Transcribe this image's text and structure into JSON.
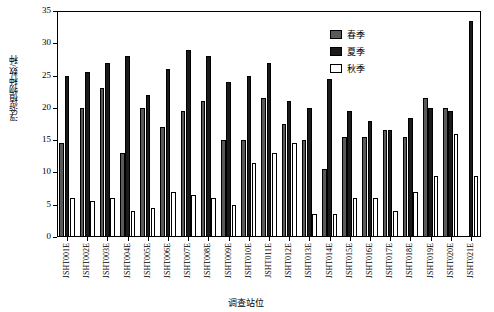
{
  "chart_data": {
    "type": "bar",
    "title": "",
    "xlabel": "调查站位",
    "ylabel": "浮游植物种数/种",
    "ylim": [
      0,
      35
    ],
    "yticks": [
      0,
      5,
      10,
      15,
      20,
      25,
      30,
      35
    ],
    "grid": false,
    "legend_position": "top-right",
    "categories": [
      "JSHT001E",
      "JSHT002E",
      "JSHT003E",
      "JSHT004E",
      "JSHT005E",
      "JSHT006E",
      "JSHT007E",
      "JSHT008E",
      "JSHT009E",
      "JSHT010E",
      "JSHT011E",
      "JSHT012E",
      "JSHT013E",
      "JSHT014E",
      "JSHT015E",
      "JSHT016E",
      "JSHT017E",
      "JSHT018E",
      "JSHT019E",
      "JSHT020E",
      "JSHT021E"
    ],
    "series": [
      {
        "name": "春季",
        "color": "#5a5a5a",
        "values": [
          14.5,
          20.0,
          23.0,
          13.0,
          20.0,
          17.0,
          19.5,
          21.0,
          15.0,
          15.0,
          21.5,
          17.5,
          15.0,
          10.5,
          15.5,
          15.5,
          16.5,
          15.5,
          21.5,
          20.0,
          0.0
        ]
      },
      {
        "name": "夏季",
        "color": "#1a1a1a",
        "values": [
          25.0,
          25.5,
          27.0,
          28.0,
          22.0,
          26.0,
          29.0,
          28.0,
          24.0,
          25.0,
          27.0,
          21.0,
          20.0,
          24.5,
          19.5,
          18.0,
          16.5,
          18.5,
          20.0,
          19.5,
          33.5
        ]
      },
      {
        "name": "秋季",
        "color": "#ffffff",
        "values": [
          6.0,
          5.5,
          6.0,
          4.0,
          4.5,
          7.0,
          6.5,
          6.0,
          5.0,
          11.5,
          13.0,
          14.5,
          3.5,
          3.5,
          6.0,
          6.0,
          4.0,
          7.0,
          9.5,
          16.0,
          9.5
        ]
      }
    ],
    "legend_entries": [
      "春季",
      "夏季",
      "秋季"
    ]
  }
}
